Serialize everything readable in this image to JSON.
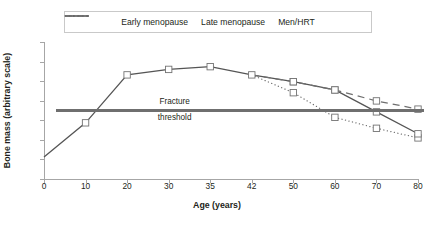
{
  "legend": {
    "position": "top",
    "items": [
      {
        "label": "Early menopause",
        "style": "dotted",
        "sample": "dotted-line-sample"
      },
      {
        "label": "Late menopause",
        "style": "solid",
        "sample": "solid-line-sample"
      },
      {
        "label": "Men/HRT",
        "style": "dashed",
        "sample": "dashed-line-sample"
      }
    ]
  },
  "annotations": {
    "fracture_threshold": {
      "line1": "Fracture",
      "line2": "threshold"
    }
  },
  "colors": {
    "line": "#6f6f6f",
    "threshold": "#6f6f6f",
    "axis": "#a6a6a6",
    "marker_fill": "#ffffff",
    "text": "#231f20"
  },
  "chart_data": {
    "type": "line",
    "title": "",
    "xlabel": "Age (years)",
    "ylabel": "Bone mass (arbitrary scale)",
    "categories": [
      "0",
      "10",
      "20",
      "30",
      "35",
      "42",
      "50",
      "60",
      "70",
      "80"
    ],
    "x_axis_kind": "categorical-uneven-values",
    "ylim": [
      0,
      10
    ],
    "y_ticks_labeled": false,
    "y_tick_count": 7,
    "grid": false,
    "threshold": {
      "label": "Fracture threshold",
      "value": 5.0
    },
    "series": [
      {
        "name": "Early menopause",
        "style": "dotted",
        "marker": "square-open",
        "x": [
          "0",
          "10",
          "20",
          "30",
          "35",
          "42",
          "50",
          "60",
          "70",
          "80"
        ],
        "values": [
          1.6,
          4.1,
          7.6,
          8.0,
          8.2,
          7.6,
          6.3,
          4.5,
          3.7,
          3.0
        ]
      },
      {
        "name": "Late menopause",
        "style": "solid",
        "marker": "square-open",
        "x": [
          "0",
          "10",
          "20",
          "30",
          "35",
          "42",
          "50",
          "60",
          "70",
          "80"
        ],
        "values": [
          1.6,
          4.1,
          7.6,
          8.0,
          8.2,
          7.6,
          7.1,
          6.5,
          4.9,
          3.3
        ]
      },
      {
        "name": "Men/HRT",
        "style": "dashed",
        "marker": "square-open",
        "x": [
          "0",
          "10",
          "20",
          "30",
          "35",
          "42",
          "50",
          "60",
          "70",
          "80"
        ],
        "values": [
          1.6,
          4.1,
          7.6,
          8.0,
          8.2,
          7.6,
          7.1,
          6.5,
          5.7,
          5.1
        ]
      }
    ]
  }
}
